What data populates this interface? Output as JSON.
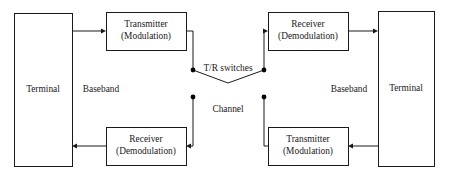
{
  "diagram": {
    "colors": {
      "background": "#ffffff",
      "stroke": "#1a1a1a",
      "text": "#1a1a1a",
      "node": "#000000"
    },
    "boxes": [
      {
        "id": "terminal-left",
        "name": "terminal-left",
        "label": "Terminal",
        "lines": [
          "Terminal"
        ],
        "x": 14,
        "y": 13,
        "w": 58,
        "h": 153
      },
      {
        "id": "transmitter-left",
        "name": "transmitter-left",
        "label": "Transmitter (Modulation)",
        "lines": [
          "Transmitter",
          "(Modulation)"
        ],
        "x": 106,
        "y": 12,
        "w": 80,
        "h": 38
      },
      {
        "id": "receiver-right",
        "name": "receiver-right",
        "label": "Receiver (Demodulation)",
        "lines": [
          "Receiver",
          "(Demodulation)"
        ],
        "x": 268,
        "y": 12,
        "w": 80,
        "h": 38
      },
      {
        "id": "terminal-right",
        "name": "terminal-right",
        "label": "Terminal",
        "lines": [
          "Terminal"
        ],
        "x": 378,
        "y": 11,
        "w": 56,
        "h": 155
      },
      {
        "id": "receiver-left",
        "name": "receiver-left",
        "label": "Receiver (Demodulation)",
        "lines": [
          "Receiver",
          "(Demodulation)"
        ],
        "x": 106,
        "y": 127,
        "w": 80,
        "h": 38
      },
      {
        "id": "transmitter-right",
        "name": "transmitter-right",
        "label": "Transmitter (Modulation)",
        "lines": [
          "Transmitter",
          "(Modulation)"
        ],
        "x": 268,
        "y": 127,
        "w": 80,
        "h": 38
      }
    ],
    "free_labels": [
      {
        "id": "baseband-left",
        "name": "baseband-label-left",
        "text": "Baseband",
        "x": 101,
        "y": 90
      },
      {
        "id": "baseband-right",
        "name": "baseband-label-right",
        "text": "Baseband",
        "x": 349,
        "y": 90
      },
      {
        "id": "tr-switches",
        "name": "tr-switches-label",
        "text": "T/R switches",
        "x": 228,
        "y": 69
      },
      {
        "id": "channel",
        "name": "channel-label",
        "text": "Channel",
        "x": 228,
        "y": 110
      }
    ],
    "nodes": [
      {
        "id": "node-tx-switch",
        "name": "switch-node-transmit-left",
        "x": 193,
        "y": 70
      },
      {
        "id": "node-rx-switch",
        "name": "switch-node-receive-right",
        "x": 264,
        "y": 70
      },
      {
        "id": "node-ch-left",
        "name": "channel-node-left",
        "x": 193,
        "y": 97
      },
      {
        "id": "node-ch-right",
        "name": "channel-node-right",
        "x": 264,
        "y": 97
      }
    ],
    "connections": [
      {
        "id": "conn-terminal-to-transmitter",
        "name": "link-terminal-left-to-transmitter-left",
        "path": "M72,31 L103,31",
        "arrow": {
          "x": 106,
          "y": 31,
          "dir": "right"
        }
      },
      {
        "id": "conn-transmitter-to-switch",
        "name": "link-transmitter-left-to-switch",
        "path": "M186,31 L193,31 L193,70",
        "arrow": null
      },
      {
        "id": "conn-switch-closed-upper",
        "name": "switch-blade-upper",
        "path": "M193,70 L228,83 L264,70",
        "arrow": null
      },
      {
        "id": "conn-switch-to-receiver",
        "name": "link-switch-to-receiver-right",
        "path": "M264,70 L264,31 L265,31",
        "arrow": {
          "x": 268,
          "y": 31,
          "dir": "right"
        }
      },
      {
        "id": "conn-receiver-to-terminal",
        "name": "link-receiver-right-to-terminal-right",
        "path": "M348,31 L375,31",
        "arrow": {
          "x": 378,
          "y": 31,
          "dir": "right"
        }
      },
      {
        "id": "conn-terminal-to-transmitter-right",
        "name": "link-terminal-right-to-transmitter-right",
        "path": "M378,146 L351,146",
        "arrow": {
          "x": 348,
          "y": 146,
          "dir": "left"
        }
      },
      {
        "id": "conn-transmitter-right-to-channel",
        "name": "link-transmitter-right-to-channel-node",
        "path": "M268,146 L264,146 L264,97",
        "arrow": null
      },
      {
        "id": "conn-channel-left-to-receiver",
        "name": "link-channel-node-to-receiver-left",
        "path": "M193,97 L193,146 L190,146",
        "arrow": {
          "x": 186,
          "y": 146,
          "dir": "left"
        }
      },
      {
        "id": "conn-receiver-left-to-terminal",
        "name": "link-receiver-left-to-terminal-left",
        "path": "M106,146 L75,146",
        "arrow": {
          "x": 72,
          "y": 146,
          "dir": "left"
        }
      }
    ]
  }
}
